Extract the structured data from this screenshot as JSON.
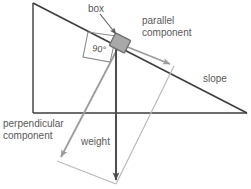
{
  "diagram": {
    "labels": {
      "box": "box",
      "angle": "90°",
      "parallel_line1": "parallel",
      "parallel_line2": "component",
      "slope": "slope",
      "perpendicular_line1": "perpendicular",
      "perpendicular_line2": "component",
      "weight": "weight"
    },
    "colors": {
      "slope_line": "#3d3d3d",
      "weight_arrow": "#4d4d4d",
      "component_arrow": "#9c9c9c",
      "parallelogram_line": "#b3b3b3",
      "box_fill": "#a8a8a8",
      "box_stroke": "#6e6e6e",
      "text": "#595959",
      "angle_marker": "#7a7a7a",
      "leader_line": "#5a5a5a"
    },
    "geometry": {
      "triangle_apex": [
        33,
        3
      ],
      "triangle_bottom_left": [
        33,
        113
      ],
      "triangle_bottom_right": [
        247,
        113
      ],
      "box_center": [
        120,
        44
      ],
      "box_width": 17,
      "box_height": 14,
      "weight_tip": [
        116,
        184
      ],
      "parallel_tip": [
        174,
        66
      ],
      "perpendicular_tip": [
        57,
        161
      ]
    }
  }
}
